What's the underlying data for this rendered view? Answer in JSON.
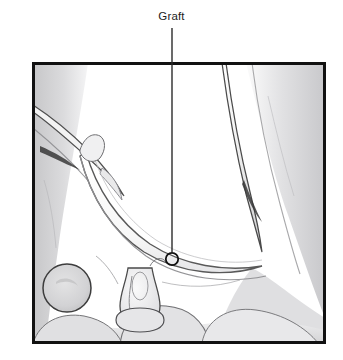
{
  "figure": {
    "type": "anatomical-line-illustration",
    "background_color": "#ffffff",
    "panel": {
      "border_color": "#111111",
      "border_width_px": 3,
      "x": 32,
      "y": 62,
      "width": 294,
      "height": 282,
      "fill_color": "#ffffff"
    }
  },
  "annotation": {
    "label": "Graft",
    "label_color": "#1d1d1d",
    "leader_line": {
      "color": "#2b2b2b",
      "width_px": 1.4,
      "x": 172,
      "y_start": 28,
      "y_end": 252
    },
    "marker": {
      "shape": "circle",
      "outline_color": "#111111",
      "fill": "none",
      "cx": 172,
      "cy": 259,
      "r": 6.2,
      "stroke_width_px": 1.8
    }
  },
  "palette": {
    "ink_dark": "#2f2f2f",
    "ink_mid": "#6b6b6b",
    "ink_light": "#a8a8a8",
    "tissue_pale": "#ececed",
    "tissue_mid": "#dcdcde",
    "tissue_gray": "#c9c9cb",
    "tissue_deep": "#b4b4b6",
    "white": "#ffffff"
  },
  "structures": [
    {
      "name": "graft-arch",
      "description": "curved tubular graft sweeping from upper left to lower right",
      "stroke": "#5a5a5a"
    },
    {
      "name": "right-vessel-trunk",
      "description": "long vertical vessel descending along the right side",
      "stroke": "#4a4a4a"
    },
    {
      "name": "left-vessel-branch",
      "description": "diagonal vessel with small branch entering upper left",
      "stroke": "#4f4f4f"
    },
    {
      "name": "anastomosis-stump",
      "description": "vertical tubular anastomosis stump at lower center",
      "stroke": "#4a4a4a"
    },
    {
      "name": "round-mass",
      "description": "circular structure at lower left",
      "stroke": "#3d3d3d"
    },
    {
      "name": "tissue-field-left",
      "description": "gray tissue field along left margin",
      "fill": "#d6d6d8"
    },
    {
      "name": "tissue-field-right",
      "description": "gray tissue mass at right and lower right",
      "fill": "#dedee0"
    },
    {
      "name": "tissue-field-bottom",
      "description": "pale tissue band across the bottom",
      "fill": "#e4e4e6"
    }
  ]
}
